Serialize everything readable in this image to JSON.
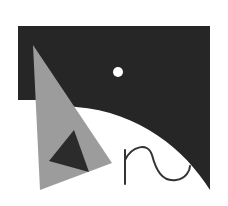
{
  "artwork": {
    "description": "Abstract geometric composition",
    "colors": {
      "background": "#ffffff",
      "dark": "#262626",
      "gray": "#9c9c9c",
      "inner_dark": "#2b2b2b",
      "dot": "#ffffff",
      "stroke": "#333333"
    },
    "shapes": {
      "dark_panel": "M18,26 L210,26 L210,190 C185,150 140,112 76,107 L40,100 L18,100 Z",
      "gray_triangle": "33,45 112,163 40,190",
      "inner_triangle": "74,130 89,172 49,161",
      "dot": {
        "cx": 118,
        "cy": 72,
        "r": 5
      },
      "squiggle": "M125,184 L125,150 M125,160 C132,146 148,142 152,155 C156,170 162,182 176,180 C186,179 190,170 190,166"
    }
  }
}
